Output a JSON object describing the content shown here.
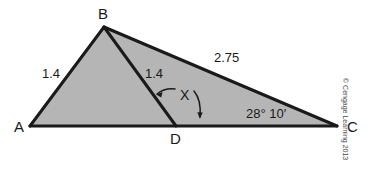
{
  "figure": {
    "type": "geometry-diagram",
    "colors": {
      "fill": "#b5b5b5",
      "stroke": "#1a1a1a",
      "background": "#ffffff",
      "text": "#1a1a1a",
      "copyright_text": "#4a4a4a"
    },
    "vertices": [
      {
        "name": "A",
        "label": "A",
        "x": 30,
        "y": 126,
        "label_x": 14,
        "label_y": 119
      },
      {
        "name": "B",
        "label": "B",
        "x": 104,
        "y": 27,
        "label_x": 98,
        "label_y": 6
      },
      {
        "name": "C",
        "label": "C",
        "x": 337,
        "y": 126,
        "label_x": 347,
        "label_y": 119
      },
      {
        "name": "D",
        "label": "D",
        "x": 176,
        "y": 126,
        "label_x": 170,
        "label_y": 131
      }
    ],
    "segments": [
      {
        "name": "side-AB",
        "from": "A",
        "to": "B",
        "label": "1.4",
        "label_x": 42,
        "label_y": 67
      },
      {
        "name": "cevian-BD",
        "from": "B",
        "to": "D",
        "label": "1.4",
        "label_x": 145,
        "label_y": 67
      },
      {
        "name": "side-BC",
        "from": "B",
        "to": "C",
        "label": "2.75",
        "label_x": 214,
        "label_y": 51
      },
      {
        "name": "base-AC",
        "from": "A",
        "to": "C",
        "label": "",
        "label_x": 0,
        "label_y": 0
      }
    ],
    "angles": [
      {
        "name": "angle-x-at-D",
        "label": "X",
        "label_x": 180,
        "label_y": 88,
        "vertex": "D"
      },
      {
        "name": "angle-at-C",
        "label": "28° 10′",
        "label_x": 246,
        "label_y": 107,
        "vertex": "C"
      }
    ],
    "copyright": "© Cengage Learning 2013"
  }
}
